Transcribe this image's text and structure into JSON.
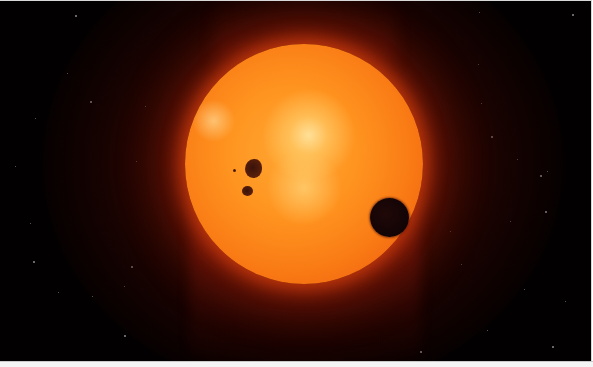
{
  "scene": {
    "description": "Red/orange star with sunspots and a dark transiting planet against a starfield",
    "background_color": "#020000",
    "star": {
      "center": [
        303,
        162
      ],
      "radius": 119,
      "core_color": "#ffa733",
      "limb_color": "#d8450c"
    },
    "planet": {
      "center": [
        390,
        216
      ],
      "radius": 19.5,
      "color": "#120405"
    },
    "sunspots": [
      {
        "center": [
          253,
          167
        ],
        "radius": 9
      },
      {
        "center": [
          247,
          190
        ],
        "radius": 5
      }
    ],
    "background_stars": [
      [
        75,
        14
      ],
      [
        67,
        72
      ],
      [
        35,
        117
      ],
      [
        90,
        100
      ],
      [
        15,
        165
      ],
      [
        30,
        222
      ],
      [
        33,
        260
      ],
      [
        58,
        291
      ],
      [
        124,
        285
      ],
      [
        124,
        334
      ],
      [
        92,
        295
      ],
      [
        145,
        105
      ],
      [
        131,
        265
      ],
      [
        136,
        160
      ],
      [
        479,
        11
      ],
      [
        572,
        13
      ],
      [
        478,
        63
      ],
      [
        481,
        102
      ],
      [
        491,
        135
      ],
      [
        547,
        170
      ],
      [
        517,
        158
      ],
      [
        540,
        174
      ],
      [
        461,
        263
      ],
      [
        524,
        288
      ],
      [
        545,
        210
      ],
      [
        591,
        240
      ],
      [
        487,
        329
      ],
      [
        552,
        345
      ],
      [
        450,
        230
      ],
      [
        565,
        300
      ],
      [
        420,
        350
      ],
      [
        510,
        220
      ]
    ]
  }
}
